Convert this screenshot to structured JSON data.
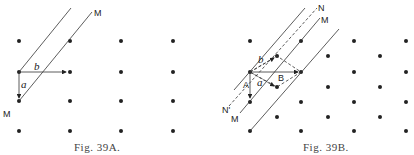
{
  "figures": [
    {
      "id": "fig-39a",
      "caption": "Fig. 39A.",
      "labels": {
        "line_top": "M",
        "line_bottom": "M",
        "vector_a": "a",
        "vector_b": "b"
      },
      "lattice": {
        "type": "rectangular",
        "columns_x": [
          19,
          70,
          121,
          173
        ],
        "rows_y": [
          41,
          72,
          101,
          131
        ]
      }
    },
    {
      "id": "fig-39b",
      "caption": "Fig. 39B.",
      "labels": {
        "line_N_top": "N",
        "line_M_top": "M",
        "line_N_bottom": "N'",
        "line_M_bottom": "M",
        "vector_a": "a",
        "vector_b": "b",
        "vector_A": "A",
        "vector_B": "B"
      },
      "lattice": {
        "type": "centered-rectangular",
        "columns_x": [
          250,
          301,
          354,
          406
        ],
        "rows_y": [
          41,
          72,
          102,
          131
        ],
        "centers_x": [
          277,
          328,
          380
        ],
        "centers_y": [
          56,
          87,
          117
        ]
      }
    }
  ],
  "colors": {
    "ink": "#222222",
    "caption": "#444444",
    "background": "#ffffff"
  }
}
